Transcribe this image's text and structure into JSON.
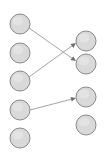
{
  "diagram": {
    "type": "bipartite-graph",
    "title": "",
    "canvas": {
      "width": 105,
      "height": 158,
      "background": "#ffffff"
    },
    "style": {
      "node_fill": "#d9d9d9",
      "node_stroke": "#8a8a8a",
      "node_radius": 10,
      "edge_color": "#9a9a9a",
      "arrowhead_color": "#6e6e6e"
    },
    "left_column": {
      "name": "left-node-column",
      "x": 20,
      "nodes": [
        {
          "id": "L1",
          "label": "",
          "cx": 20,
          "cy": 24
        },
        {
          "id": "L2",
          "label": "",
          "cx": 20,
          "cy": 53
        },
        {
          "id": "L3",
          "label": "",
          "cx": 20,
          "cy": 81
        },
        {
          "id": "L4",
          "label": "",
          "cx": 20,
          "cy": 110
        },
        {
          "id": "L5",
          "label": "",
          "cx": 20,
          "cy": 138
        }
      ]
    },
    "right_column": {
      "name": "right-node-column",
      "x": 86,
      "nodes": [
        {
          "id": "R1",
          "label": "",
          "cx": 86,
          "cy": 41
        },
        {
          "id": "R2",
          "label": "",
          "cx": 86,
          "cy": 64
        },
        {
          "id": "R3",
          "label": "",
          "cx": 86,
          "cy": 97
        },
        {
          "id": "R4",
          "label": "",
          "cx": 86,
          "cy": 125
        }
      ]
    },
    "edges": [
      {
        "id": "E1",
        "from": "L1",
        "to": "R2",
        "directed": true,
        "x1": 29,
        "y1": 28,
        "x2": 76,
        "y2": 61
      },
      {
        "id": "E2",
        "from": "L3",
        "to": "R1",
        "directed": true,
        "x1": 29,
        "y1": 77,
        "x2": 76,
        "y2": 43
      },
      {
        "id": "E3",
        "from": "L4",
        "to": "R3",
        "directed": true,
        "x1": 30,
        "y1": 110,
        "x2": 76,
        "y2": 98
      }
    ]
  }
}
